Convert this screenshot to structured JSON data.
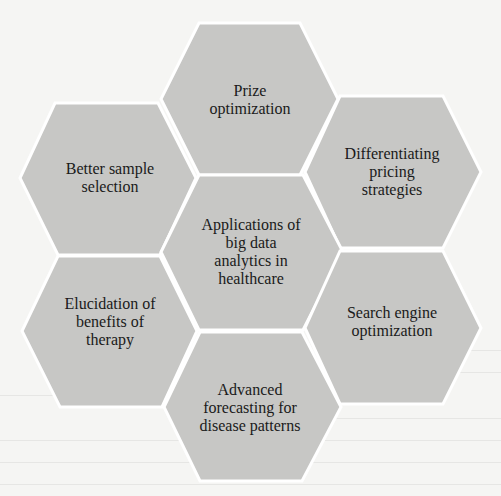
{
  "diagram": {
    "type": "hexagon-cluster",
    "colors": {
      "hex_fill": "#c7c7c5",
      "hex_border": "#ffffff",
      "background": "#f5f5f3",
      "text": "#1a1a1a"
    },
    "center": {
      "label": "Applications of\nbig data\nanalytics in\nhealthcare"
    },
    "petals": [
      {
        "id": "top",
        "label": "Prize\noptimization"
      },
      {
        "id": "upper-right",
        "label": "Differentiating\npricing\nstrategies"
      },
      {
        "id": "lower-right",
        "label": "Search engine\noptimization"
      },
      {
        "id": "bottom",
        "label": "Advanced\nforecasting for\ndisease patterns"
      },
      {
        "id": "lower-left",
        "label": "Elucidation of\nbenefits of\ntherapy"
      },
      {
        "id": "upper-left",
        "label": "Better sample\nselection"
      }
    ]
  }
}
